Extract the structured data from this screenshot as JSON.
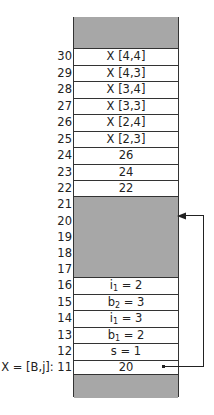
{
  "diagram": {
    "cells": [
      {
        "addr": "30",
        "content": "X [4,4]"
      },
      {
        "addr": "29",
        "content": "X [4,3]"
      },
      {
        "addr": "28",
        "content": "X [3,4]"
      },
      {
        "addr": "27",
        "content": "X [3,3]"
      },
      {
        "addr": "26",
        "content": "X [2,4]"
      },
      {
        "addr": "25",
        "content": "X [2,3]"
      },
      {
        "addr": "24",
        "content": "26"
      },
      {
        "addr": "23",
        "content": "24"
      },
      {
        "addr": "22",
        "content": "22"
      },
      {
        "addr": "21",
        "content": ""
      },
      {
        "addr": "20",
        "content": ""
      },
      {
        "addr": "19",
        "content": ""
      },
      {
        "addr": "18",
        "content": ""
      },
      {
        "addr": "17",
        "content": ""
      },
      {
        "addr": "16",
        "content_var": "i",
        "content_sub": "1",
        "content_rest": " = 2"
      },
      {
        "addr": "15",
        "content_var": "b",
        "content_sub": "2",
        "content_rest": " = 3"
      },
      {
        "addr": "14",
        "content_var": "i",
        "content_sub": "1",
        "content_rest": " = 3"
      },
      {
        "addr": "13",
        "content_var": "b",
        "content_sub": "1",
        "content_rest": " = 2"
      },
      {
        "addr": "12",
        "content": "s = 1"
      },
      {
        "addr": "11",
        "content": "20",
        "addr_prefix": "X = [B,j]: "
      }
    ],
    "pointer": {
      "from_addr": "11",
      "to_addr": "20"
    },
    "colors": {
      "shaded": "#a7a7a7",
      "line": "#333333"
    }
  }
}
